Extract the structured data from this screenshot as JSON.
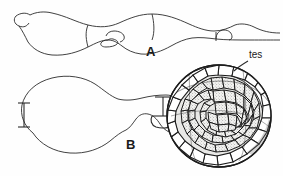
{
  "figure": {
    "background_color": "#fefefe",
    "ink_color": "#2b2b2b",
    "width": 283,
    "height": 176,
    "panels": [
      {
        "id": "A",
        "label": "A",
        "description": "elongate undulating sinuous outline specimen, lateral view"
      },
      {
        "id": "B",
        "label": "B",
        "description": "rounded ovoid specimen with attached faceted sphere, lateral view"
      }
    ],
    "annotations": [
      {
        "id": "tes",
        "label": "tes",
        "target": "faceted-sphere-rim",
        "leader": "line from text down-left to sphere margin"
      }
    ],
    "scale_bars": [
      {
        "id": "scale-bar-B",
        "orientation": "vertical",
        "position": "left of panel B"
      },
      {
        "id": "scale-bar-sphere",
        "orientation": "vertical",
        "position": "left of faceted sphere"
      }
    ]
  }
}
